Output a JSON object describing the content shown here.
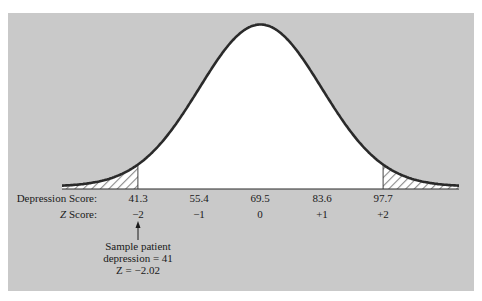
{
  "chart_data": {
    "type": "line",
    "title": "",
    "mean": 69.5,
    "sd": 14.1,
    "x_tick_labels": [
      "41.3",
      "55.4",
      "69.5",
      "83.6",
      "97.7"
    ],
    "z_tick_labels": [
      "−2",
      "−1",
      "0",
      "+1",
      "+2"
    ],
    "row_labels": {
      "x": "Depression Score:",
      "z_prefix": "Z",
      "z_suffix": " Score:"
    },
    "shaded_regions": [
      {
        "from_z": "-inf",
        "to_z": -2,
        "style": "hatched"
      },
      {
        "from_z": 2,
        "to_z": "inf",
        "style": "hatched"
      }
    ],
    "annotation": {
      "target_x": "41.3",
      "lines": [
        "Sample patient",
        "depression = 41",
        "Z = −2.02"
      ],
      "sample_value": 41,
      "sample_z": -2.02
    }
  },
  "colors": {
    "panel": "#c9c9c9",
    "curve": "#2a2a2a",
    "fill": "#ffffff",
    "hatch": "#8a8a8a"
  }
}
